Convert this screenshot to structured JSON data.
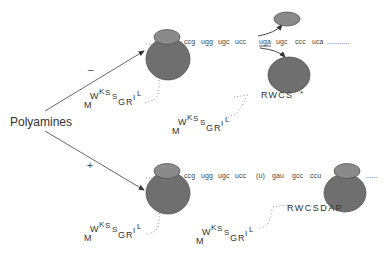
{
  "inducer": {
    "label": "Polyamines"
  },
  "colors": {
    "ribosome_large": "#6f6f6f",
    "ribosome_small": "#8a8a8a",
    "ribosome_stroke": "#4a4a4a",
    "arrow": "#444444",
    "text": "#333333"
  },
  "branches": [
    {
      "id": "minus",
      "sign": "–",
      "mrna_codons": [
        "ccg",
        "ugg",
        "ugc",
        "ucc",
        "uga",
        "ugc",
        "ccc",
        "uca"
      ],
      "stop_codon": "uga",
      "trailing_dots": "...........",
      "nascent_peptide_1": {
        "residues": [
          "M",
          "W",
          "K",
          "S",
          "S",
          "G",
          "R",
          "I",
          "L"
        ]
      },
      "nascent_peptide_2": {
        "residues": [
          "M",
          "W",
          "K",
          "S",
          "S",
          "G",
          "R",
          "I",
          "L"
        ],
        "c_term": "RWCS",
        "terminator": "*"
      },
      "outcome": "termination"
    },
    {
      "id": "plus",
      "sign": "+",
      "mrna_codons": [
        "ccg",
        "ugg",
        "ugc",
        "ucc",
        "(u)",
        "gau",
        "gcc",
        "ccu",
        "ga"
      ],
      "skipped_base": "(u)",
      "trailing_dots": "......",
      "nascent_peptide_1": {
        "residues": [
          "M",
          "W",
          "K",
          "S",
          "S",
          "G",
          "R",
          "I",
          "L"
        ]
      },
      "nascent_peptide_2": {
        "residues": [
          "M",
          "W",
          "K",
          "S",
          "S",
          "G",
          "R",
          "I",
          "L"
        ],
        "c_term": "RWCSDAP"
      },
      "outcome": "+1 frameshift"
    }
  ]
}
